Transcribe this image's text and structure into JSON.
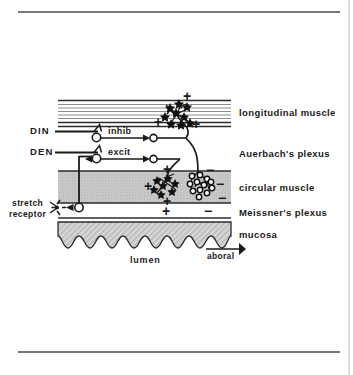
{
  "figure": {
    "background_color": "#ffffff",
    "ink_color": "#1a1a1a",
    "muscle_fill": "#c9c9c9",
    "mucosa_fill": "#cfcfcf"
  },
  "layers": [
    {
      "id": "longitudinal-muscle",
      "label": "longitudinal  muscle"
    },
    {
      "id": "auerbachs-plexus",
      "label": "Auerbach's  plexus"
    },
    {
      "id": "circular-muscle",
      "label": "circular  muscle"
    },
    {
      "id": "meissners-plexus",
      "label": "Meissner's  plexus"
    },
    {
      "id": "mucosa",
      "label": "mucosa"
    }
  ],
  "inputs": [
    {
      "id": "din",
      "label": "DIN"
    },
    {
      "id": "den",
      "label": "DEN"
    }
  ],
  "interneurons": [
    {
      "id": "inhib",
      "label": "inhib"
    },
    {
      "id": "excit",
      "label": "excit"
    }
  ],
  "receptor": {
    "line1": "stretch",
    "line2": "receptor"
  },
  "annotations": {
    "lumen": "lumen",
    "aboral": "aboral"
  },
  "signs": {
    "plus": "+",
    "minus": "−",
    "longitudinal_plus_top": "+",
    "longitudinal_plus_left": "+",
    "longitudinal_plus_right": "+",
    "circular_plus_left": "+",
    "circular_plus_bottom": "+",
    "circular_minus_top": "−",
    "circular_minus_right": "−",
    "circular_minus_lower": "−",
    "circular_minus_bottom": "−",
    "plexus_plus": "+"
  }
}
